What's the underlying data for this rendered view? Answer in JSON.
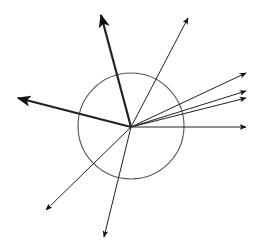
{
  "diagram": {
    "type": "vector-diagram",
    "center": [
      131,
      127
    ],
    "circle": {
      "cx": 131,
      "cy": 126,
      "r": 53,
      "stroke": "#555555"
    },
    "vectors": [
      {
        "id": "up-thick",
        "to": [
          101,
          15
        ],
        "weight": "thick"
      },
      {
        "id": "up-right",
        "to": [
          188,
          18
        ],
        "weight": "thin"
      },
      {
        "id": "right-1",
        "to": [
          246,
          73
        ],
        "weight": "thin"
      },
      {
        "id": "right-2",
        "to": [
          246,
          91
        ],
        "weight": "thin"
      },
      {
        "id": "right-3",
        "to": [
          246,
          98
        ],
        "weight": "thin"
      },
      {
        "id": "right-4",
        "to": [
          246,
          127
        ],
        "weight": "thin"
      },
      {
        "id": "left-thick",
        "to": [
          18,
          98
        ],
        "weight": "thick"
      },
      {
        "id": "down-left",
        "to": [
          46,
          210
        ],
        "weight": "thin"
      },
      {
        "id": "down",
        "to": [
          104,
          237
        ],
        "weight": "thin"
      }
    ],
    "colors": {
      "line": "#222222",
      "circle": "#555555",
      "background": "#ffffff"
    }
  }
}
